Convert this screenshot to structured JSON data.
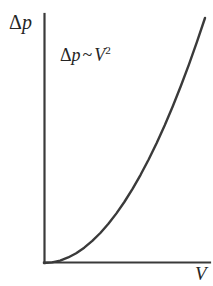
{
  "figure": {
    "background_color": "#ffffff",
    "ink_color": "#3a3a3a",
    "text_color": "#252525"
  },
  "axes": {
    "y_label_delta": "Δ",
    "y_label_var": "p",
    "x_label": "V",
    "origin_x": 44,
    "origin_y": 263,
    "y_axis_top": 14,
    "x_axis_right": 210,
    "line_width": 2.2
  },
  "annotation": {
    "lhs_delta": "Δ",
    "lhs_var": "p",
    "operator": "~",
    "rhs_var": "V",
    "rhs_exponent": "2",
    "full_text": "Δp ~ V2"
  },
  "chart_data": {
    "type": "line",
    "title": "",
    "xlabel": "V",
    "ylabel": "Δp",
    "annotations": [
      "Δp ~ V²"
    ],
    "grid": false,
    "legend": false,
    "axis_ticks": false,
    "relationship": "quadratic",
    "equation": "Δp = k·V^2",
    "xlim": [
      0,
      1
    ],
    "ylim": [
      0,
      1
    ],
    "series": [
      {
        "name": "Δp ~ V²",
        "color": "#3a3a3a",
        "x": [
          0.0,
          0.05,
          0.1,
          0.15,
          0.2,
          0.25,
          0.3,
          0.35,
          0.4,
          0.45,
          0.5,
          0.55,
          0.6,
          0.65,
          0.7,
          0.75,
          0.8,
          0.85,
          0.9,
          0.95,
          1.0
        ],
        "y": [
          0.0,
          0.0025,
          0.01,
          0.0225,
          0.04,
          0.0625,
          0.09,
          0.1225,
          0.16,
          0.2025,
          0.25,
          0.3025,
          0.36,
          0.4225,
          0.49,
          0.5625,
          0.64,
          0.7225,
          0.81,
          0.9025,
          1.0
        ]
      }
    ]
  }
}
